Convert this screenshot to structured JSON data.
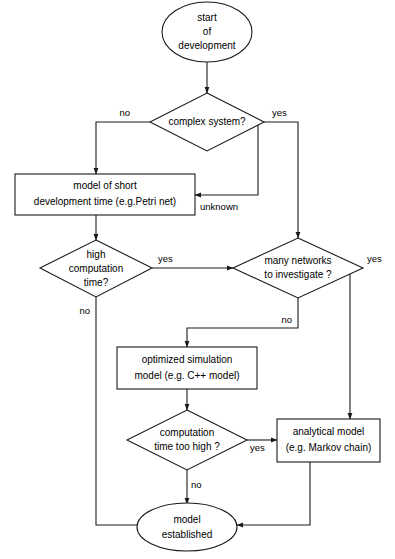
{
  "diagram": {
    "colors": {
      "stroke": "#1a1a1a",
      "fill": "#ffffff",
      "text": "#000000",
      "background": "#ffffff"
    },
    "nodes": {
      "start": {
        "shape": "ellipse",
        "line1": "start",
        "line2": "of",
        "line3": "development"
      },
      "complex_system": {
        "shape": "diamond",
        "line1": "complex system?"
      },
      "petri_model": {
        "shape": "rectangle",
        "line1": "model of short",
        "line2": "development time (e.g.Petri net)"
      },
      "high_computation": {
        "shape": "diamond",
        "line1": "high",
        "line2": "computation",
        "line3": "time?"
      },
      "many_networks": {
        "shape": "diamond",
        "line1": "many networks",
        "line2": "to investigate ?"
      },
      "optimized_simulation": {
        "shape": "rectangle",
        "line1": "optimized simulation",
        "line2": "model (e.g. C++ model)"
      },
      "computation_too_high": {
        "shape": "diamond",
        "line1": "computation",
        "line2": "time too high ?"
      },
      "analytical_model": {
        "shape": "rectangle",
        "line1": "analytical model",
        "line2": "(e.g. Markov chain)"
      },
      "model_established": {
        "shape": "ellipse",
        "line1": "model",
        "line2": "established"
      }
    },
    "edge_labels": {
      "complex_no": "no",
      "complex_yes": "yes",
      "unknown": "unknown",
      "high_comp_yes": "yes",
      "high_comp_no": "no",
      "networks_yes": "yes",
      "networks_no": "no",
      "too_high_yes": "yes",
      "too_high_no": "no"
    }
  }
}
